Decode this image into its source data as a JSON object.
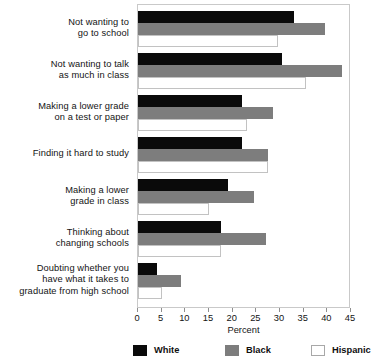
{
  "chart_data": {
    "type": "bar",
    "orientation": "horizontal",
    "title": "",
    "xlabel": "Percent",
    "ylabel": "",
    "xlim": [
      0,
      45
    ],
    "xticks": [
      0,
      5,
      10,
      15,
      20,
      25,
      30,
      35,
      40,
      45
    ],
    "grid": false,
    "legend_position": "bottom",
    "categories": [
      "Not wanting to\ngo to school",
      "Not wanting to talk\nas much in class",
      "Making a lower grade\non a test or paper",
      "Finding it hard to study",
      "Making a lower\ngrade in class",
      "Thinking about\nchanging schools",
      "Doubting whether you\nhave what it takes to\ngraduate from high school"
    ],
    "series": [
      {
        "name": "White",
        "color": "#0a0a0a",
        "values": [
          33,
          30.5,
          22,
          22,
          19,
          17.5,
          4
        ]
      },
      {
        "name": "Black",
        "color": "#7d7d7d",
        "values": [
          39.5,
          43,
          28.5,
          27.5,
          24.5,
          27,
          9
        ]
      },
      {
        "name": "Hispanic",
        "color": "#ffffff",
        "values": [
          29.5,
          35.5,
          23,
          27.5,
          15,
          17.5,
          5
        ]
      }
    ]
  },
  "axis": {
    "tick_labels": [
      "0",
      "5",
      "10",
      "15",
      "20",
      "25",
      "30",
      "35",
      "40",
      "45"
    ],
    "x_title": "Percent"
  },
  "categories_display": [
    {
      "line1": "Not wanting to",
      "line2": "go to school",
      "line3": ""
    },
    {
      "line1": "Not wanting to talk",
      "line2": "as much in class",
      "line3": ""
    },
    {
      "line1": "Making a lower grade",
      "line2": "on a test or paper",
      "line3": ""
    },
    {
      "line1": "Finding it hard to study",
      "line2": "",
      "line3": ""
    },
    {
      "line1": "Making a lower",
      "line2": "grade in class",
      "line3": ""
    },
    {
      "line1": "Thinking about",
      "line2": "changing schools",
      "line3": ""
    },
    {
      "line1": "Doubting whether you",
      "line2": "have what it takes to",
      "line3": "graduate from high school"
    }
  ],
  "legend": {
    "items": [
      {
        "label": "White",
        "color": "#0a0a0a"
      },
      {
        "label": "Black",
        "color": "#7d7d7d"
      },
      {
        "label": "Hispanic",
        "color": "#ffffff"
      }
    ]
  }
}
